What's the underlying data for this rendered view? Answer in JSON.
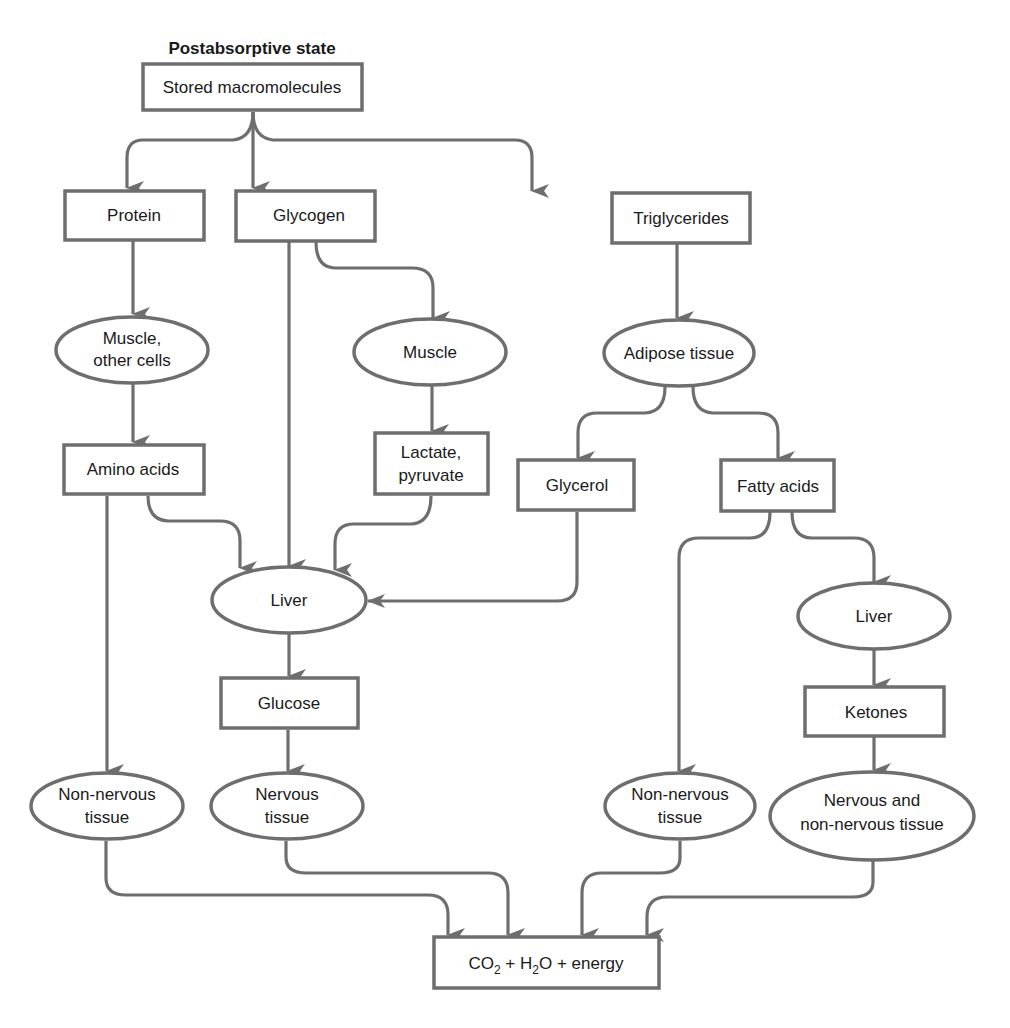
{
  "title": "Postabsorptive state",
  "colors": {
    "stroke": "#6e6e6e",
    "text": "#1a1a1a",
    "background": "#ffffff"
  },
  "nodes": {
    "stored": {
      "shape": "box",
      "lines": [
        "Stored macromolecules"
      ]
    },
    "protein": {
      "shape": "box",
      "lines": [
        "Protein"
      ]
    },
    "glycogen": {
      "shape": "box",
      "lines": [
        "Glycogen"
      ]
    },
    "triglycerides": {
      "shape": "box",
      "lines": [
        "Triglycerides"
      ]
    },
    "muscle_other": {
      "shape": "ellipse",
      "lines": [
        "Muscle,",
        "other cells"
      ]
    },
    "muscle": {
      "shape": "ellipse",
      "lines": [
        "Muscle"
      ]
    },
    "adipose": {
      "shape": "ellipse",
      "lines": [
        "Adipose tissue"
      ]
    },
    "amino_acids": {
      "shape": "box",
      "lines": [
        "Amino acids"
      ]
    },
    "lactate": {
      "shape": "box",
      "lines": [
        "Lactate,",
        "pyruvate"
      ]
    },
    "glycerol": {
      "shape": "box",
      "lines": [
        "Glycerol"
      ]
    },
    "fatty_acids": {
      "shape": "box",
      "lines": [
        "Fatty acids"
      ]
    },
    "liver_left": {
      "shape": "ellipse",
      "lines": [
        "Liver"
      ]
    },
    "liver_right": {
      "shape": "ellipse",
      "lines": [
        "Liver"
      ]
    },
    "glucose": {
      "shape": "box",
      "lines": [
        "Glucose"
      ]
    },
    "ketones": {
      "shape": "box",
      "lines": [
        "Ketones"
      ]
    },
    "nonnervous_left": {
      "shape": "ellipse",
      "lines": [
        "Non-nervous",
        "tissue"
      ]
    },
    "nervous": {
      "shape": "ellipse",
      "lines": [
        "Nervous",
        "tissue"
      ]
    },
    "nonnervous_right": {
      "shape": "ellipse",
      "lines": [
        "Non-nervous",
        "tissue"
      ]
    },
    "nervous_and_nonnervous": {
      "shape": "ellipse",
      "lines": [
        "Nervous and",
        "non-nervous tissue"
      ]
    },
    "output": {
      "shape": "box",
      "parts": [
        "CO",
        "2",
        " + H",
        "2",
        "O + energy"
      ],
      "label": "CO2 + H2O + energy"
    }
  },
  "edges": [
    {
      "from": "stored",
      "to": "protein"
    },
    {
      "from": "stored",
      "to": "glycogen"
    },
    {
      "from": "stored",
      "to": "triglycerides"
    },
    {
      "from": "protein",
      "to": "muscle_other"
    },
    {
      "from": "glycogen",
      "to": "muscle"
    },
    {
      "from": "glycogen",
      "to": "liver_left"
    },
    {
      "from": "triglycerides",
      "to": "adipose"
    },
    {
      "from": "muscle_other",
      "to": "amino_acids"
    },
    {
      "from": "muscle",
      "to": "lactate"
    },
    {
      "from": "adipose",
      "to": "glycerol"
    },
    {
      "from": "adipose",
      "to": "fatty_acids"
    },
    {
      "from": "amino_acids",
      "to": "liver_left"
    },
    {
      "from": "amino_acids",
      "to": "nonnervous_left"
    },
    {
      "from": "lactate",
      "to": "liver_left"
    },
    {
      "from": "glycerol",
      "to": "liver_left"
    },
    {
      "from": "fatty_acids",
      "to": "nonnervous_right"
    },
    {
      "from": "fatty_acids",
      "to": "liver_right"
    },
    {
      "from": "liver_left",
      "to": "glucose"
    },
    {
      "from": "glucose",
      "to": "nervous"
    },
    {
      "from": "liver_right",
      "to": "ketones"
    },
    {
      "from": "ketones",
      "to": "nervous_and_nonnervous"
    },
    {
      "from": "nonnervous_left",
      "to": "output"
    },
    {
      "from": "nervous",
      "to": "output"
    },
    {
      "from": "nonnervous_right",
      "to": "output"
    },
    {
      "from": "nervous_and_nonnervous",
      "to": "output"
    }
  ]
}
